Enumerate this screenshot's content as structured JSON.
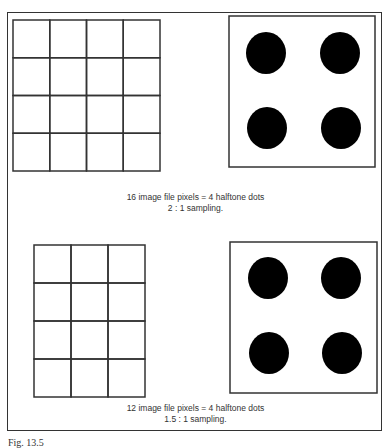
{
  "figure": {
    "label": "Fig. 13.5",
    "panels": [
      {
        "name": "two-to-one",
        "grid": {
          "columns": 4,
          "rows": 4,
          "x": 13,
          "y": 20,
          "cell_w": 36.75,
          "cell_h": 37.75
        },
        "halftone": {
          "x": 229,
          "y": 16,
          "w": 146,
          "h": 151,
          "dots": [
            [
              266,
              53
            ],
            [
              340,
              53
            ],
            [
              267,
              128
            ],
            [
              341,
              128
            ]
          ],
          "r": 20
        },
        "caption_line1": "16 image file pixels = 4 halftone dots",
        "caption_line2": "2 : 1 sampling."
      },
      {
        "name": "one-point-five-to-one",
        "grid": {
          "columns": 3,
          "rows": 4,
          "x": 34,
          "y": 245,
          "cell_w": 37,
          "cell_h": 38
        },
        "halftone": {
          "x": 230,
          "y": 242,
          "w": 147,
          "h": 151,
          "dots": [
            [
              268,
              278
            ],
            [
              341,
              278
            ],
            [
              269,
              353
            ],
            [
              342,
              353
            ]
          ],
          "r": 20
        },
        "caption_line1": "12 image file pixels = 4 halftone dots",
        "caption_line2": "1.5 : 1 sampling."
      }
    ]
  },
  "colors": {
    "line": "#333333",
    "dot": "#000000",
    "background": "#ffffff"
  }
}
